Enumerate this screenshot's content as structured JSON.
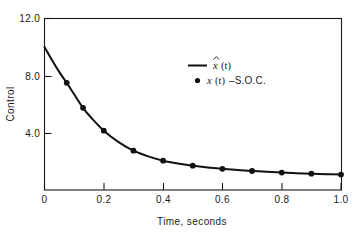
{
  "chart_data": {
    "type": "line",
    "title": "",
    "subtitle": "",
    "xlabel": "Time, seconds",
    "ylabel": "Control",
    "xlim": [
      0,
      1.0
    ],
    "ylim": [
      0,
      12.0
    ],
    "xticks": [
      0,
      0.2,
      0.4,
      0.6,
      0.8,
      1.0
    ],
    "xticklabels": [
      "0",
      "0.2",
      "0.4",
      "0.6",
      "0.8",
      "1.0"
    ],
    "yticks": [
      4.0,
      8.0,
      12.0
    ],
    "yticklabels": [
      "4.0",
      "8.0",
      "12.0"
    ],
    "grid": false,
    "legend_position": "upper-right-inside",
    "series": [
      {
        "name": "x̂ (t)",
        "style": "line",
        "x": [
          0.0,
          0.025,
          0.05,
          0.075,
          0.1,
          0.13,
          0.16,
          0.2,
          0.25,
          0.3,
          0.35,
          0.4,
          0.45,
          0.5,
          0.55,
          0.6,
          0.65,
          0.7,
          0.75,
          0.8,
          0.85,
          0.9,
          0.95,
          1.0
        ],
        "y": [
          10.0,
          9.1,
          8.25,
          7.5,
          6.7,
          5.75,
          5.0,
          4.15,
          3.35,
          2.75,
          2.35,
          2.05,
          1.85,
          1.7,
          1.58,
          1.48,
          1.4,
          1.33,
          1.27,
          1.22,
          1.18,
          1.14,
          1.11,
          1.08
        ]
      },
      {
        "name": "x (t)–S.O.C.",
        "style": "markers",
        "x": [
          0.075,
          0.13,
          0.2,
          0.3,
          0.4,
          0.5,
          0.6,
          0.7,
          0.8,
          0.9,
          1.0
        ],
        "y": [
          7.5,
          5.75,
          4.15,
          2.75,
          2.05,
          1.7,
          1.48,
          1.33,
          1.22,
          1.14,
          1.08
        ]
      }
    ],
    "legend": [
      {
        "label_main": "x",
        "label_arg": "(t)",
        "hat": true,
        "marker": "line"
      },
      {
        "label_main": "x",
        "label_arg": "(t)",
        "label_suffix": "–S.O.C.",
        "hat": false,
        "marker": "dot"
      }
    ],
    "colors": {
      "curve": "#111111",
      "marker": "#111111",
      "axis": "#1a1a1a",
      "background": "#ffffff"
    }
  }
}
